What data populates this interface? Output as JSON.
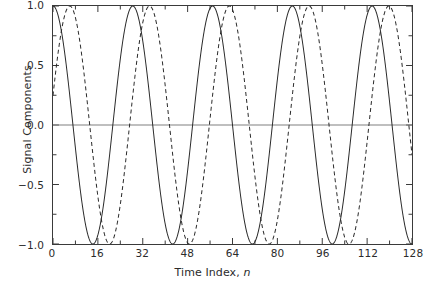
{
  "figure": {
    "background_color": "#ffffff",
    "frame_color": "#3a3a3a"
  },
  "axes": {
    "x": {
      "label_prefix": "Time Index, ",
      "label_symbol": "n",
      "ticks": [
        "0",
        "16",
        "32",
        "48",
        "64",
        "80",
        "96",
        "112",
        "128"
      ],
      "minor_ticks_per_interval": 1
    },
    "y": {
      "label": "Signal Components",
      "ticks": [
        "1.0",
        "0.5",
        "0.0",
        "-0.5",
        "-1.0"
      ],
      "minor_ticks_per_interval": 1
    }
  },
  "chart_data": {
    "type": "line",
    "title": "",
    "xlabel": "Time Index, n",
    "ylabel": "Signal Components",
    "xlim": [
      0,
      128
    ],
    "ylim": [
      -1.0,
      1.0
    ],
    "xticks": [
      0,
      16,
      32,
      48,
      64,
      80,
      96,
      112,
      128
    ],
    "yticks": [
      -1.0,
      -0.5,
      0.0,
      0.5,
      1.0
    ],
    "grid": false,
    "zero_line": true,
    "zero_line_color": "#808080",
    "legend": null,
    "series": [
      {
        "name": "component-1",
        "style": "solid",
        "color": "#2a2a2a",
        "line_width": 1.0,
        "form": "cosine",
        "amplitude": 1.0,
        "cycles_over_range": 4.5,
        "period_samples": 28.44,
        "phase_radians": 0.0,
        "peaks_at": [
          0,
          28.4,
          56.9,
          85.3,
          113.8
        ],
        "troughs_at": [
          14.2,
          42.7,
          71.1,
          99.6,
          128.0
        ]
      },
      {
        "name": "component-2",
        "style": "dashed",
        "color": "#2a2a2a",
        "line_width": 1.0,
        "dash_pattern": [
          4,
          3
        ],
        "form": "cosine",
        "amplitude": 1.0,
        "cycles_over_range": 4.5,
        "period_samples": 28.44,
        "phase_radians": -1.32,
        "value_at_zero": 0.25,
        "peaks_at": [
          6.0,
          34.4,
          62.9,
          91.3,
          119.8
        ],
        "troughs_at": [
          20.2,
          48.7,
          77.1,
          105.6
        ]
      }
    ]
  }
}
